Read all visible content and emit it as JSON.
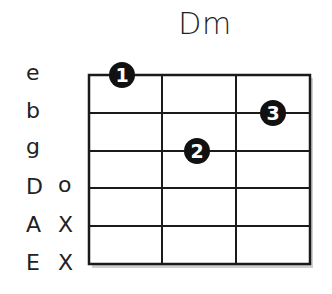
{
  "chord": {
    "name": "Dm"
  },
  "strings": [
    {
      "name": "e",
      "state": ""
    },
    {
      "name": "b",
      "state": ""
    },
    {
      "name": "g",
      "state": ""
    },
    {
      "name": "D",
      "state": "o"
    },
    {
      "name": "A",
      "state": "X"
    },
    {
      "name": "E",
      "state": "X"
    }
  ],
  "fingers": [
    {
      "finger": "1",
      "string": "e",
      "fret": 1
    },
    {
      "finger": "3",
      "string": "b",
      "fret": 3
    },
    {
      "finger": "2",
      "string": "g",
      "fret": 2
    }
  ],
  "frets_shown": 3,
  "colors": {
    "line": "#1a1a1a",
    "dot": "#111111",
    "dot_text": "#ffffff",
    "shadow": "#bbbbbb"
  }
}
